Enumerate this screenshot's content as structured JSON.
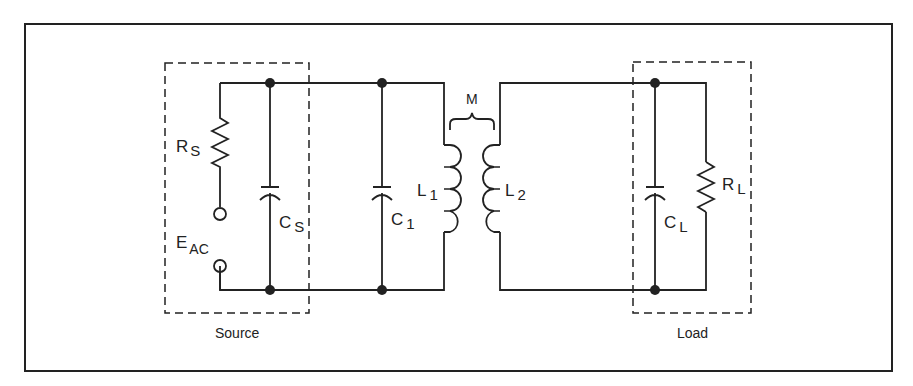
{
  "diagram": {
    "type": "circuit-schematic",
    "title": "",
    "colors": {
      "line": "#222222",
      "background": "#ffffff"
    },
    "boxes": {
      "source": {
        "label": "Source"
      },
      "load": {
        "label": "Load"
      }
    },
    "components": {
      "rs": {
        "main": "R",
        "sub": "S"
      },
      "eac": {
        "main": "E",
        "sub": "AC"
      },
      "cs": {
        "main": "C",
        "sub": "S"
      },
      "c1": {
        "main": "C",
        "sub": "1"
      },
      "l1": {
        "main": "L",
        "sub": "1"
      },
      "l2": {
        "main": "L",
        "sub": "2"
      },
      "m": {
        "main": "M"
      },
      "cl": {
        "main": "C",
        "sub": "L"
      },
      "rl": {
        "main": "R",
        "sub": "L"
      }
    }
  }
}
